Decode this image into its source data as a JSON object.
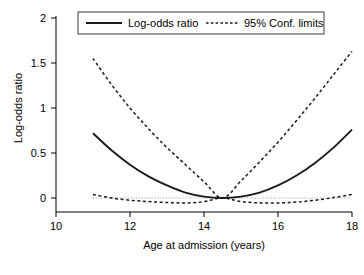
{
  "chart_data": {
    "type": "line",
    "title": "",
    "xlabel": "Age at admission (years)",
    "ylabel": "Log-odds ratio",
    "xlim": [
      10,
      18
    ],
    "ylim": [
      0,
      2
    ],
    "xticks": [
      10,
      12,
      14,
      16,
      18
    ],
    "xtick_labels": [
      "10",
      "12",
      "14",
      "16",
      "18"
    ],
    "yticks": [
      0,
      0.5,
      1,
      1.5,
      2
    ],
    "ytick_labels": [
      "0",
      "0.5",
      "1",
      "1.5",
      "2"
    ],
    "grid": false,
    "legend_position": "top-center",
    "reference_line": {
      "y": 0,
      "style": "dotted",
      "color": "#9a9a9a"
    },
    "vertex": {
      "x": 14.5,
      "y": 0
    },
    "x": [
      11,
      11.5,
      12,
      12.5,
      13,
      13.5,
      14,
      14.5,
      15,
      15.5,
      16,
      16.5,
      17,
      17.5,
      18
    ],
    "series": [
      {
        "name": "Log-odds ratio",
        "style": "solid",
        "color": "#1a1a1a",
        "values": [
          0.72,
          0.53,
          0.37,
          0.24,
          0.14,
          0.06,
          0.015,
          0.0,
          0.015,
          0.06,
          0.14,
          0.25,
          0.39,
          0.56,
          0.76
        ]
      },
      {
        "name": "95% Conf. limits (upper)",
        "style": "dashed",
        "color": "#1a1a1a",
        "values": [
          1.55,
          1.26,
          1.0,
          0.77,
          0.56,
          0.37,
          0.18,
          0.0,
          0.19,
          0.4,
          0.62,
          0.86,
          1.11,
          1.37,
          1.63
        ]
      },
      {
        "name": "95% Conf. limits (lower)",
        "style": "dashed",
        "color": "#1a1a1a",
        "values": [
          0.04,
          0.0,
          -0.025,
          -0.04,
          -0.05,
          -0.055,
          -0.04,
          0.0,
          -0.04,
          -0.055,
          -0.055,
          -0.045,
          -0.025,
          0.005,
          0.04
        ]
      }
    ]
  },
  "legend": {
    "entries": [
      {
        "label": "Log-odds ratio",
        "marker": "solid-line"
      },
      {
        "label": "95% Conf. limits",
        "marker": "dotted-line"
      }
    ]
  },
  "axes": {
    "x_title": "Age at admission (years)",
    "y_title": "Log-odds ratio",
    "x_tick_labels": [
      "10",
      "12",
      "14",
      "16",
      "18"
    ],
    "y_tick_labels": [
      "0",
      "0.5",
      "1",
      "1.5",
      "2"
    ]
  },
  "colors": {
    "line": "#1a1a1a",
    "reference": "#9a9a9a",
    "axis": "#000000",
    "background": "#ffffff"
  }
}
